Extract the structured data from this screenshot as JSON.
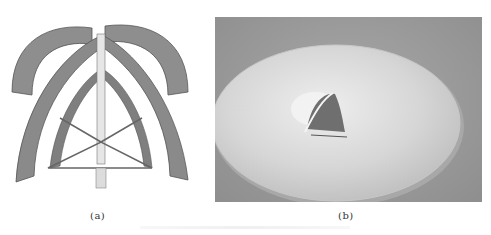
{
  "figure": {
    "panels": [
      {
        "id": "a",
        "label": "(a)",
        "content": "3D model of intersecting arched shell structure"
      },
      {
        "id": "b",
        "label": "(b)",
        "content": "Photo of circular disc with central arched element"
      }
    ]
  },
  "colors": {
    "arch_fill": "#8c8c8c",
    "arch_edge": "#5a5a5a",
    "photo_bg": "#9a9a9a",
    "disc": "#dcdcdc"
  }
}
